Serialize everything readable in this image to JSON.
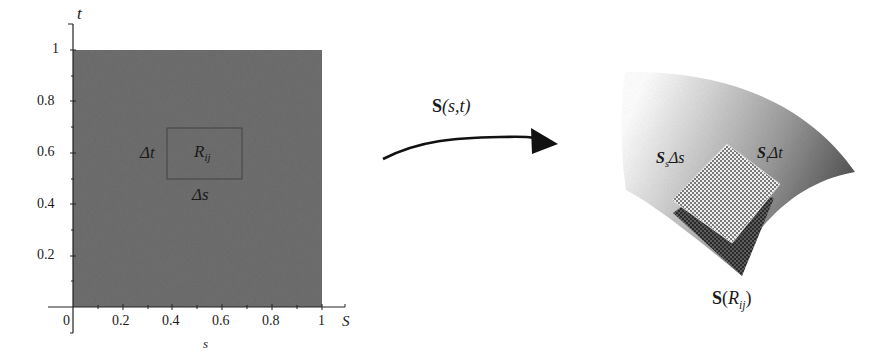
{
  "domain_view": {
    "left_plot": {
      "x_axis_label": "s",
      "x_axis_end_label": "S",
      "y_axis_label": "t",
      "x_ticks": [
        "0",
        "0.2",
        "0.4",
        "0.6",
        "0.8",
        "1"
      ],
      "y_ticks": [
        "0.2",
        "0.4",
        "0.6",
        "0.8",
        "1"
      ],
      "region_fill": "#6e6e6e",
      "subrectangle": {
        "label_main": "R",
        "label_sub": "ij",
        "width_label": "Δs",
        "height_label": "Δt",
        "s_range": [
          0.38,
          0.68
        ],
        "t_range": [
          0.5,
          0.7
        ]
      }
    },
    "mapping_arrow": {
      "label_fn": "S",
      "label_args": "(s,t)"
    },
    "surface": {
      "patch_label_main": "S",
      "patch_label_arg": "R",
      "patch_label_sub": "ij",
      "edge_s_label_main": "S",
      "edge_s_label_sub": "s",
      "edge_s_label_tail": "Δs",
      "edge_t_label_main": "S",
      "edge_t_label_sub": "t",
      "edge_t_label_tail": "Δt",
      "gradient_light": "#f4f4f4",
      "gradient_dark": "#4a4a4a"
    }
  }
}
